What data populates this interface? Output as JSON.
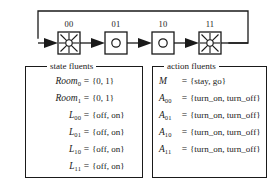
{
  "figure": {
    "diagram": {
      "name": "state-transition-chain",
      "nodes": [
        {
          "id": "n00",
          "label": "00",
          "icon": "lamp-on-icon",
          "state": "on"
        },
        {
          "id": "n01",
          "label": "01",
          "icon": "lamp-off-icon",
          "state": "off"
        },
        {
          "id": "n10",
          "label": "10",
          "icon": "lamp-off-icon",
          "state": "off"
        },
        {
          "id": "n11",
          "label": "11",
          "icon": "lamp-on-icon",
          "state": "on"
        }
      ],
      "edges": [
        {
          "from": "start",
          "to": "n00"
        },
        {
          "from": "n00",
          "to": "n01"
        },
        {
          "from": "n01",
          "to": "n10"
        },
        {
          "from": "n10",
          "to": "n11"
        },
        {
          "from": "n11",
          "to": "n00",
          "type": "feedback-loop"
        }
      ],
      "line_color": "#1a1a1a"
    },
    "state_fluents": {
      "legend": "state fluents",
      "rows": [
        {
          "name": "Room",
          "sub": "0",
          "eq": "=",
          "value": "{0, 1}"
        },
        {
          "name": "Room",
          "sub": "1",
          "eq": "=",
          "value": "{0, 1}"
        },
        {
          "name": "L",
          "sub": "00",
          "eq": "=",
          "value": "{off, on}"
        },
        {
          "name": "L",
          "sub": "01",
          "eq": "=",
          "value": "{off, on}"
        },
        {
          "name": "L",
          "sub": "10",
          "eq": "=",
          "value": "{off, on}"
        },
        {
          "name": "L",
          "sub": "11",
          "eq": "=",
          "value": "{off, on}"
        }
      ]
    },
    "action_fluents": {
      "legend": "action fluents",
      "rows": [
        {
          "name": "M",
          "sub": "",
          "eq": "=",
          "value": "{stay, go}"
        },
        {
          "name": "A",
          "sub": "00",
          "eq": "=",
          "value": "{turn_on, turn_off}"
        },
        {
          "name": "A",
          "sub": "01",
          "eq": "=",
          "value": "{turn_on, turn_off}"
        },
        {
          "name": "A",
          "sub": "10",
          "eq": "=",
          "value": "{turn_on, turn_off}"
        },
        {
          "name": "A",
          "sub": "11",
          "eq": "=",
          "value": "{turn_on, turn_off}"
        }
      ]
    }
  }
}
